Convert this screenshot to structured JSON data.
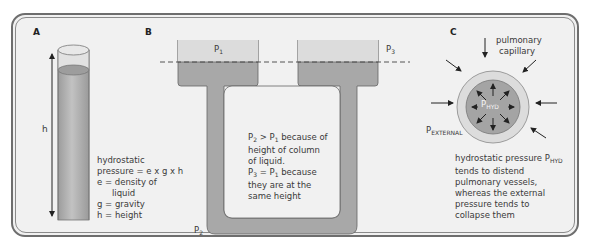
{
  "panels": {
    "a": {
      "label": "A",
      "height_label": "h",
      "formula_lines": [
        "hydrostatic",
        "pressure = e x g x h",
        "e = density of",
        "liquid",
        "g = gravity",
        "h = height"
      ]
    },
    "b": {
      "label": "B",
      "p1": "P",
      "p1_sub": "1",
      "p3": "P",
      "p3_sub": "3",
      "p2": "P",
      "p2_sub": "2",
      "explanation": {
        "l1_a": "P",
        "l1_a_sub": "2",
        "l1_b": " > P",
        "l1_b_sub": "1",
        "l1_c": " because of",
        "l2": "height of column",
        "l3": "of liquid.",
        "l4_a": "P",
        "l4_a_sub": "3",
        "l4_b": " = P",
        "l4_b_sub": "1",
        "l4_c": " because",
        "l5": "they are at the",
        "l6": "same height"
      }
    },
    "c": {
      "label": "C",
      "capillary_lines": [
        "pulmonary",
        "capillary"
      ],
      "p_hyd": "P",
      "p_hyd_sub": "HYD",
      "p_ext": "P",
      "p_ext_sub": "EXTERNAL",
      "desc": {
        "l1_a": "hydrostatic pressure P",
        "l1_sub": "HYD",
        "l2": "tends to distend",
        "l3": "pulmonary vessels,",
        "l4": "whereas the external",
        "l5": "pressure tends to",
        "l6": "collapse them"
      }
    }
  },
  "colors": {
    "frame": "#6e6e6e",
    "background": "#f1f1f1",
    "liquid": "#a9a9a9",
    "air": "#d6d6d6",
    "vessel_wall": "#dcdcdc"
  }
}
